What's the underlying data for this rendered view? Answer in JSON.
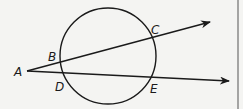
{
  "figure": {
    "colors": {
      "background": "#f4f4f2",
      "stroke": "#1a1a1a",
      "border": "#555555"
    },
    "circle": {
      "cx": 108,
      "cy": 56,
      "r": 48
    },
    "points": {
      "A": {
        "label": "A",
        "x": 27,
        "y": 71
      },
      "B": {
        "label": "B",
        "x": 61,
        "y": 62
      },
      "C": {
        "label": "C",
        "x": 152,
        "y": 38
      },
      "D": {
        "label": "D",
        "x": 61,
        "y": 72
      },
      "E": {
        "label": "E",
        "x": 151,
        "y": 77
      }
    },
    "rays": [
      {
        "name": "ray-ABC",
        "from": "A",
        "through": [
          "B",
          "C"
        ],
        "tip": {
          "x": 210,
          "y": 22
        }
      },
      {
        "name": "ray-ADE",
        "from": "A",
        "through": [
          "D",
          "E"
        ],
        "tip": {
          "x": 229,
          "y": 81
        }
      }
    ]
  }
}
